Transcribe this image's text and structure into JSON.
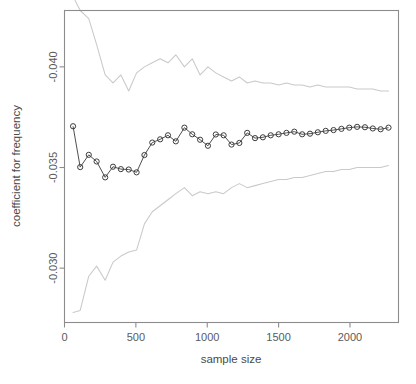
{
  "chart_data": {
    "type": "line",
    "title": "",
    "subtitle": "",
    "xlabel": "sample size",
    "ylabel": "coefficient for frequency",
    "xlim": [
      0,
      2340
    ],
    "ylim": [
      -0.0428,
      -0.0273
    ],
    "y_axis_inverted": true,
    "grid": false,
    "legend": "none",
    "x_ticks": [
      0,
      500,
      1000,
      1500,
      2000
    ],
    "x_tick_labels": [
      "0",
      "500",
      "1000",
      "1500",
      "2000"
    ],
    "y_ticks": [
      -0.04,
      -0.035,
      -0.03
    ],
    "y_tick_labels": [
      "-0.040",
      "-0.035",
      "-0.030"
    ],
    "colors": {
      "series": "#3d3d3d",
      "band": "#c9c9c9",
      "axis": "#8c8c8c",
      "text": "#5a5a5a",
      "background": "#ffffff"
    },
    "marker": "open-circle",
    "x": [
      60,
      110,
      170,
      225,
      285,
      340,
      395,
      450,
      505,
      560,
      615,
      670,
      725,
      780,
      840,
      895,
      950,
      1005,
      1060,
      1115,
      1170,
      1225,
      1280,
      1335,
      1390,
      1445,
      1500,
      1555,
      1610,
      1665,
      1720,
      1775,
      1830,
      1885,
      1940,
      1995,
      2050,
      2105,
      2160,
      2215,
      2270
    ],
    "series": [
      {
        "name": "coefficient estimate",
        "style": "line-with-open-circle-markers",
        "values": [
          -0.03705,
          -0.03502,
          -0.03563,
          -0.0353,
          -0.03451,
          -0.03504,
          -0.03492,
          -0.0349,
          -0.03476,
          -0.03562,
          -0.03624,
          -0.0364,
          -0.0366,
          -0.0363,
          -0.03698,
          -0.03665,
          -0.03638,
          -0.03608,
          -0.03664,
          -0.0366,
          -0.03614,
          -0.03622,
          -0.03672,
          -0.03646,
          -0.0365,
          -0.0366,
          -0.03665,
          -0.03672,
          -0.03678,
          -0.03665,
          -0.03668,
          -0.03675,
          -0.03682,
          -0.03686,
          -0.03692,
          -0.03698,
          -0.03702,
          -0.037,
          -0.03694,
          -0.0369,
          -0.03698
        ]
      },
      {
        "name": "upper confidence bound",
        "style": "line",
        "values": [
          -0.0435,
          -0.0428,
          -0.0424,
          -0.0411,
          -0.0396,
          -0.0392,
          -0.0396,
          -0.0388,
          -0.0397,
          -0.04,
          -0.0402,
          -0.0404,
          -0.0402,
          -0.0406,
          -0.04,
          -0.0404,
          -0.0396,
          -0.04,
          -0.0397,
          -0.0395,
          -0.0393,
          -0.0395,
          -0.0392,
          -0.0393,
          -0.0392,
          -0.0392,
          -0.0391,
          -0.0392,
          -0.0391,
          -0.0391,
          -0.039,
          -0.0391,
          -0.039,
          -0.039,
          -0.039,
          -0.039,
          -0.0389,
          -0.0389,
          -0.0389,
          -0.0388,
          -0.0388
        ]
      },
      {
        "name": "lower confidence bound",
        "style": "line",
        "values": [
          -0.0278,
          -0.0279,
          -0.0296,
          -0.0301,
          -0.0294,
          -0.0303,
          -0.0306,
          -0.0308,
          -0.0309,
          -0.0322,
          -0.0328,
          -0.0331,
          -0.0334,
          -0.0337,
          -0.034,
          -0.0336,
          -0.0338,
          -0.0337,
          -0.0338,
          -0.0337,
          -0.034,
          -0.0342,
          -0.034,
          -0.0341,
          -0.0342,
          -0.0343,
          -0.0344,
          -0.0344,
          -0.0345,
          -0.0345,
          -0.0346,
          -0.0347,
          -0.0348,
          -0.0348,
          -0.0349,
          -0.0349,
          -0.035,
          -0.035,
          -0.035,
          -0.035,
          -0.0351
        ]
      }
    ]
  },
  "axes": {
    "x_title": "sample size",
    "y_title": "coefficient for frequency"
  }
}
